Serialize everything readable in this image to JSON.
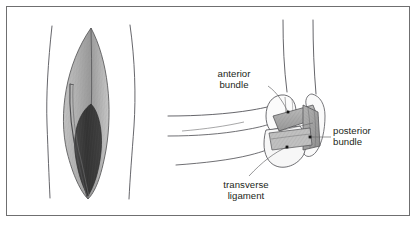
{
  "figure": {
    "frame_color": "#6f6f70",
    "background_color": "#ffffff",
    "ink_color": "#231f20"
  },
  "panels": [
    {
      "id": "left-panel",
      "name": "limb-muscle-cross-section",
      "description": "Lens-shaped shaded muscle belly between two limb contour lines"
    },
    {
      "id": "right-panel",
      "name": "elbow-ligament-diagram",
      "description": "Flexed elbow with banded collateral ligament shown"
    }
  ],
  "labels": [
    {
      "id": "anterior-bundle",
      "line1": "anterior",
      "line2": "bundle",
      "align": "center"
    },
    {
      "id": "posterior-bundle",
      "line1": "posterior",
      "line2": "bundle",
      "align": "left"
    },
    {
      "id": "transverse-ligament",
      "line1": "transverse",
      "line2": "ligament",
      "align": "center"
    }
  ],
  "colors": {
    "outline": "#4a4a4c",
    "muscle_light": "#b9b9b9",
    "muscle_mid": "#9d9d9d",
    "muscle_dark": "#3b3b3b",
    "ligament_fill": "#a9a9a9",
    "ligament_light": "#c6c6c6",
    "marker_dot": "#1a1a1a",
    "leader_line": "#58585a"
  }
}
